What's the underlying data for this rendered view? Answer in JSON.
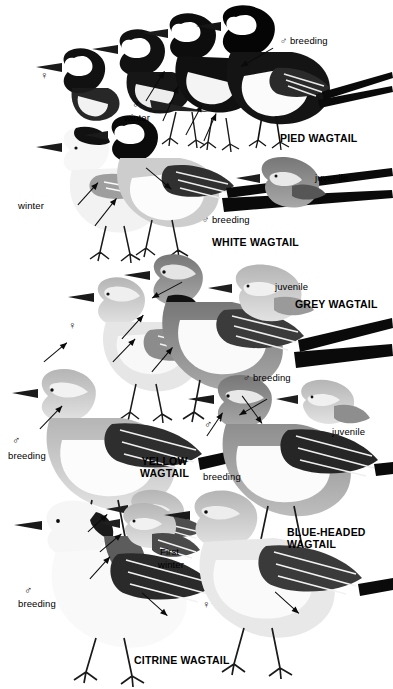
{
  "plate": {
    "title": "Wagtails identification plate",
    "width": 393,
    "height": 689,
    "background": "#ffffff",
    "ink": "#000000",
    "style": "grayscale field-guide illustration"
  },
  "symbols": {
    "male": "♂",
    "female": "♀"
  },
  "species": [
    {
      "id": "pied-wagtail",
      "name": "PIED WAGTAIL",
      "name_x": 280,
      "name_y": 133,
      "labels": [
        {
          "id": "pied-female",
          "text": "♀",
          "x": 40,
          "y": 70,
          "kind": "symbol"
        },
        {
          "id": "pied-male-winter-1",
          "text": "♂",
          "x": 132,
          "y": 99,
          "kind": "symbol"
        },
        {
          "id": "pied-winter",
          "text": "winter",
          "x": 124,
          "y": 112,
          "kind": "plain"
        },
        {
          "id": "pied-male-breeding",
          "text": "♂ breeding",
          "x": 280,
          "y": 35,
          "kind": "plain"
        }
      ]
    },
    {
      "id": "white-wagtail",
      "name": "WHITE WAGTAIL",
      "name_x": 212,
      "name_y": 237,
      "labels": [
        {
          "id": "white-winter",
          "text": "winter",
          "x": 18,
          "y": 200,
          "kind": "plain"
        },
        {
          "id": "white-juvenile",
          "text": "juvenile",
          "x": 315,
          "y": 172,
          "kind": "plain"
        },
        {
          "id": "white-male-breeding",
          "text": "♂ breeding",
          "x": 202,
          "y": 214,
          "kind": "plain"
        }
      ]
    },
    {
      "id": "grey-wagtail",
      "name": "GREY WAGTAIL",
      "name_x": 295,
      "name_y": 299,
      "labels": [
        {
          "id": "grey-juvenile",
          "text": "juvenile",
          "x": 275,
          "y": 281,
          "kind": "plain"
        },
        {
          "id": "grey-female",
          "text": "♀",
          "x": 68,
          "y": 320,
          "kind": "symbol"
        },
        {
          "id": "grey-male-breeding",
          "text": "♂ breeding",
          "x": 243,
          "y": 372,
          "kind": "plain"
        }
      ]
    },
    {
      "id": "yellow-wagtail",
      "name": "YELLOW\nWAGTAIL",
      "name_x": 140,
      "name_y": 456,
      "labels": [
        {
          "id": "yellow-male",
          "text": "♂",
          "x": 12,
          "y": 435,
          "kind": "symbol"
        },
        {
          "id": "yellow-breeding",
          "text": "breeding",
          "x": 8,
          "y": 450,
          "kind": "plain"
        },
        {
          "id": "yellow-juvenile",
          "text": "juvenile",
          "x": 332,
          "y": 426,
          "kind": "plain"
        }
      ]
    },
    {
      "id": "blue-headed-wagtail",
      "name": "BLUE-HEADED\nWAGTAIL",
      "name_x": 287,
      "name_y": 527,
      "labels": [
        {
          "id": "blue-male",
          "text": "♂",
          "x": 204,
          "y": 419,
          "kind": "symbol"
        },
        {
          "id": "blue-breeding",
          "text": "breeding",
          "x": 203,
          "y": 471,
          "kind": "plain"
        }
      ]
    },
    {
      "id": "citrine-wagtail",
      "name": "CITRINE WAGTAIL",
      "name_x": 134,
      "name_y": 655,
      "labels": [
        {
          "id": "citrine-male",
          "text": "♂",
          "x": 24,
          "y": 585,
          "kind": "symbol"
        },
        {
          "id": "citrine-breeding",
          "text": "breeding",
          "x": 18,
          "y": 598,
          "kind": "plain"
        },
        {
          "id": "citrine-first",
          "text": "First",
          "x": 160,
          "y": 546,
          "kind": "plain"
        },
        {
          "id": "citrine-first-winter",
          "text": "winter",
          "x": 158,
          "y": 559,
          "kind": "plain"
        },
        {
          "id": "citrine-female",
          "text": "♀",
          "x": 202,
          "y": 599,
          "kind": "symbol"
        }
      ]
    }
  ],
  "arrows": [
    {
      "id": "arrow-pied-male-breeding",
      "x": 273,
      "y": 44,
      "len": 37,
      "angle": 150
    },
    {
      "id": "arrow-pied-winter",
      "x": 146,
      "y": 97,
      "len": 35,
      "angle": -58
    },
    {
      "id": "arrow-pied-flank",
      "x": 163,
      "y": 117,
      "len": 38,
      "angle": -66
    },
    {
      "id": "arrow-pied-breast",
      "x": 186,
      "y": 131,
      "len": 34,
      "angle": -62
    },
    {
      "id": "arrow-pied-belly",
      "x": 204,
      "y": 137,
      "len": 30,
      "angle": -66
    },
    {
      "id": "arrow-white-mantle",
      "x": 146,
      "y": 164,
      "len": 33,
      "angle": 40
    },
    {
      "id": "arrow-white-flank",
      "x": 78,
      "y": 201,
      "len": 30,
      "angle": -48
    },
    {
      "id": "arrow-white-belly",
      "x": 95,
      "y": 222,
      "len": 35,
      "angle": -52
    },
    {
      "id": "arrow-grey-throat",
      "x": 182,
      "y": 278,
      "len": 34,
      "angle": 152
    },
    {
      "id": "arrow-grey-flank1",
      "x": 122,
      "y": 335,
      "len": 32,
      "angle": -48
    },
    {
      "id": "arrow-grey-flank2",
      "x": 113,
      "y": 358,
      "len": 32,
      "angle": -46
    },
    {
      "id": "arrow-grey-belly",
      "x": 152,
      "y": 368,
      "len": 32,
      "angle": -50
    },
    {
      "id": "arrow-grey-female",
      "x": 44,
      "y": 358,
      "len": 30,
      "angle": -40
    },
    {
      "id": "arrow-yellow-wing",
      "x": 40,
      "y": 425,
      "len": 32,
      "angle": -46
    },
    {
      "id": "arrow-blue-breeding",
      "x": 242,
      "y": 392,
      "len": 34,
      "angle": 54
    },
    {
      "id": "arrow-blue-head",
      "x": 207,
      "y": 432,
      "len": 28,
      "angle": -56
    },
    {
      "id": "arrow-blue-nape",
      "x": 267,
      "y": 395,
      "len": 32,
      "angle": 150
    },
    {
      "id": "arrow-citrine-head",
      "x": 90,
      "y": 575,
      "len": 30,
      "angle": -48
    },
    {
      "id": "arrow-citrine-nape",
      "x": 100,
      "y": 548,
      "len": 28,
      "angle": -40
    },
    {
      "id": "arrow-citrine-vent",
      "x": 142,
      "y": 589,
      "len": 34,
      "angle": 42
    },
    {
      "id": "arrow-citrine-female",
      "x": 275,
      "y": 588,
      "len": 32,
      "angle": 42
    },
    {
      "id": "arrow-citrine-shoulder",
      "x": 88,
      "y": 528,
      "len": 26,
      "angle": -42
    }
  ]
}
